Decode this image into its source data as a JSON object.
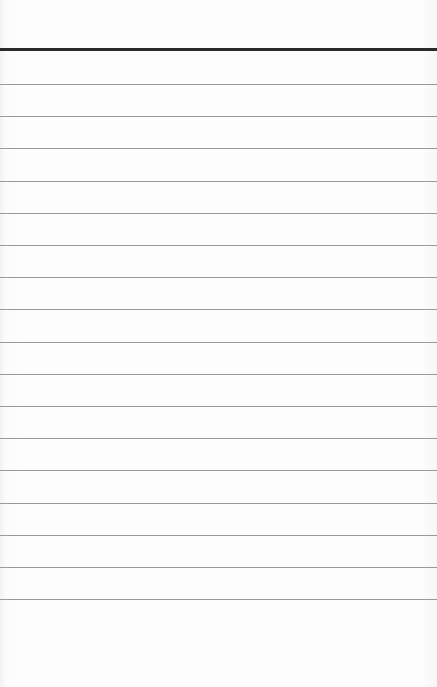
{
  "paper": {
    "background": "#fdfdfd",
    "header_rule": {
      "y": 48,
      "thickness": 3,
      "color": "#2a2a2a"
    },
    "ruled_lines": {
      "first_y": 84,
      "spacing": 32.2,
      "count": 17,
      "color": "#9a9a9a"
    },
    "lines": [
      "",
      "",
      "",
      "",
      "",
      "",
      "",
      "",
      "",
      "",
      "",
      "",
      "",
      "",
      "",
      "",
      ""
    ]
  }
}
